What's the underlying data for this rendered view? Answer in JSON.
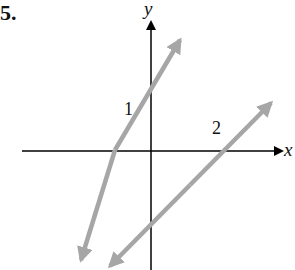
{
  "problem_number": "5.",
  "axes": {
    "x_label": "x",
    "y_label": "y"
  },
  "lines": [
    {
      "name": "line-1",
      "label": "1",
      "color": "#a6a6a6"
    },
    {
      "name": "line-2",
      "label": "2",
      "color": "#a6a6a6"
    }
  ],
  "colors": {
    "axis": "#000000",
    "line": "#a6a6a6"
  }
}
